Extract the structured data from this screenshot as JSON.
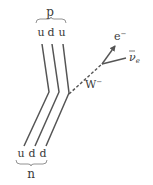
{
  "diagram": {
    "top_particle": {
      "label": "p",
      "quarks": [
        "u",
        "d",
        "u"
      ]
    },
    "bottom_particle": {
      "label": "n",
      "quarks": [
        "u",
        "d",
        "d"
      ]
    },
    "boson": {
      "label": "W",
      "charge": "−"
    },
    "electron": {
      "label": "e",
      "charge": "−"
    },
    "antineutrino": {
      "label": "ν",
      "subscript": "e"
    },
    "colors": {
      "line": "#555555",
      "text": "#3a3a3a",
      "background": "#ffffff"
    }
  }
}
